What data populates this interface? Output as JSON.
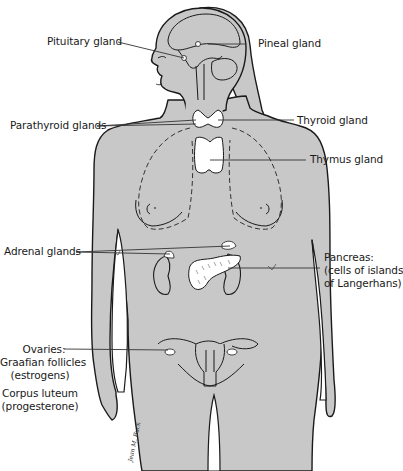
{
  "diagram": {
    "colors": {
      "body_fill": "#c8c8c8",
      "outline": "#1a1a1a",
      "gland_fill": "#ffffff",
      "leader_line": "#333333",
      "background": "#ffffff"
    },
    "labels": {
      "pituitary": "Pituitary gland",
      "pineal": "Pineal gland",
      "parathyroid": "Parathyroid glands",
      "thyroid": "Thyroid gland",
      "thymus": "Thymus gland",
      "adrenal": "Adrenal glands",
      "pancreas_line1": "Pancreas:",
      "pancreas_line2": "(cells of islands",
      "pancreas_line3": "of Langerhans)",
      "ovaries": "Ovaries:",
      "graafian_line1": "Graafian follicles",
      "graafian_line2": "(estrogens)",
      "corpus_line1": "Corpus luteum",
      "corpus_line2": "(progesterone)"
    },
    "signature": "Jean M. Buck"
  }
}
